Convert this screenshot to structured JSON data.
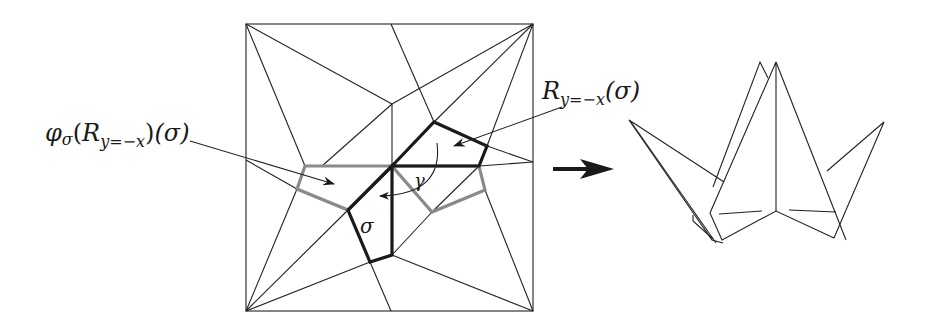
{
  "figure": {
    "left_label": "φσ(Ry=−x)(σ)",
    "left_label_parts": {
      "phi": "φ",
      "phi_sub": "σ",
      "open1": "(",
      "R": "R",
      "R_sub": "y=−x",
      "close1": ")",
      "arg": "(σ)"
    },
    "right_label": "Ry=−x(σ)",
    "right_label_parts": {
      "R": "R",
      "R_sub": "y=−x",
      "arg": "(σ)"
    },
    "sigma_label": "σ",
    "gamma_label": "γ",
    "arrow_icon": "right-arrow",
    "colors": {
      "line": "#222222",
      "thick": "#1a1a1a",
      "gray": "#8a8a8a",
      "background": "#ffffff"
    }
  }
}
